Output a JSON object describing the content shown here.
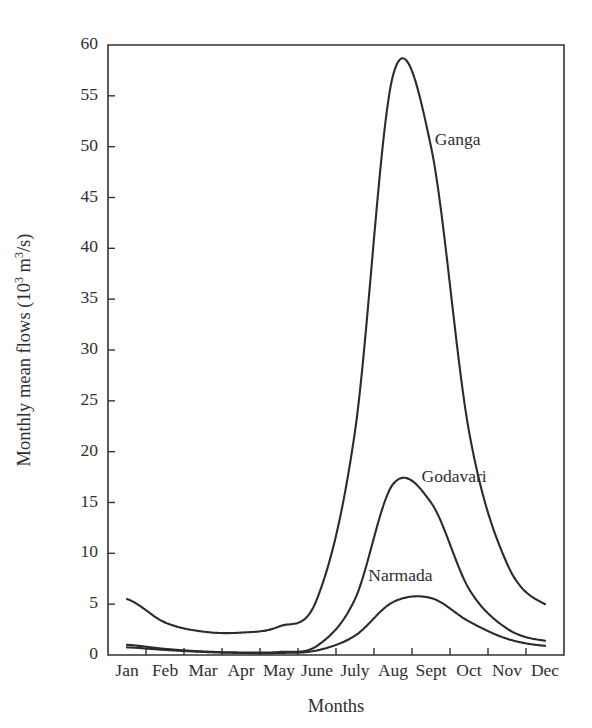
{
  "chart_data": {
    "type": "line",
    "title": "",
    "xlabel": "Months",
    "ylabel": "Monthly mean flows (10^3 m^3/s)",
    "ylabel_parts": {
      "prefix": "Monthly mean flows (10",
      "exponent1": "3",
      "middle": " m",
      "exponent2": "3",
      "suffix": "/s)"
    },
    "categories": [
      "Jan",
      "Feb",
      "Mar",
      "Apr",
      "May",
      "June",
      "July",
      "Aug",
      "Sept",
      "Oct",
      "Nov",
      "Dec"
    ],
    "x": [
      1,
      2,
      3,
      4,
      5,
      6,
      7,
      8,
      9,
      10,
      11,
      12
    ],
    "ylim": [
      0,
      60
    ],
    "xlim": [
      0.5,
      12.5
    ],
    "ytick_values": [
      0,
      5,
      10,
      15,
      20,
      25,
      30,
      35,
      40,
      45,
      50,
      55,
      60
    ],
    "ytick_labels": [
      "0",
      "5",
      "10",
      "15",
      "20",
      "25",
      "30",
      "35",
      "40",
      "45",
      "50",
      "55",
      "60"
    ],
    "grid": false,
    "legend_position": "inline-annotations",
    "series": [
      {
        "name": "Ganga",
        "color": "#2b2b2b",
        "values": [
          5.5,
          3.2,
          2.3,
          2.2,
          2.8,
          5.5,
          22.0,
          57.0,
          50.0,
          22.0,
          9.0,
          5.0
        ],
        "peak_value": 58.4,
        "peak_month": "Aug",
        "label": "Ganga",
        "label_x_month": 9.1,
        "label_y_value": 50.2
      },
      {
        "name": "Godavari",
        "color": "#2b2b2b",
        "values": [
          1.0,
          0.6,
          0.35,
          0.25,
          0.3,
          0.9,
          5.5,
          16.8,
          15.0,
          6.5,
          2.6,
          1.4
        ],
        "peak_value": 17.3,
        "peak_month": "Aug",
        "label": "Godavari",
        "label_x_month": 8.75,
        "label_y_value": 17.0
      },
      {
        "name": "Narmada",
        "color": "#2b2b2b",
        "values": [
          0.75,
          0.5,
          0.3,
          0.2,
          0.2,
          0.45,
          1.9,
          5.2,
          5.6,
          3.3,
          1.6,
          0.9
        ],
        "peak_value": 5.7,
        "peak_month": "Sept",
        "label": "Narmada",
        "label_x_month": 7.35,
        "label_y_value": 7.3
      }
    ]
  },
  "axes": {
    "y_title_text": "Monthly mean flows (10",
    "x_title_text": "Months"
  }
}
